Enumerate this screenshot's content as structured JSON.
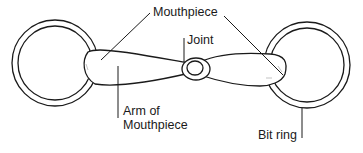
{
  "diagram": {
    "labels": {
      "mouthpiece": "Mouthpiece",
      "joint": "Joint",
      "arm_line1": "Arm of",
      "arm_line2": "Mouthpiece",
      "bit_ring": "Bit ring"
    },
    "colors": {
      "stroke": "#1a1a1a",
      "background": "#ffffff"
    }
  }
}
